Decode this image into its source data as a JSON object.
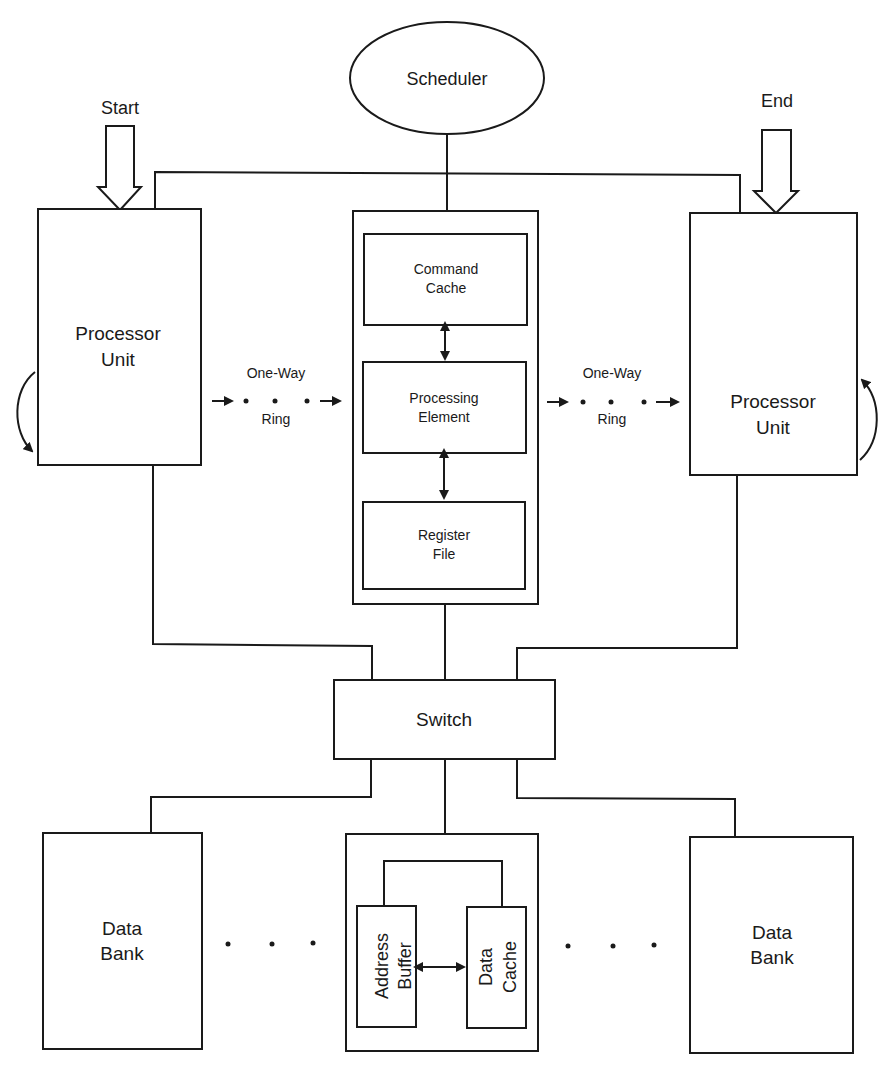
{
  "diagram": {
    "scheduler": {
      "label": "Scheduler"
    },
    "start": {
      "label": "Start"
    },
    "end": {
      "label": "End"
    },
    "left_processor": {
      "line1": "Processor",
      "line2": "Unit"
    },
    "right_processor": {
      "line1": "Processor",
      "line2": "Unit"
    },
    "left_ring": {
      "line1": "One-Way",
      "line2": "Ring"
    },
    "right_ring": {
      "line1": "One-Way",
      "line2": "Ring"
    },
    "center_unit": {
      "command_cache": {
        "line1": "Command",
        "line2": "Cache"
      },
      "processing_element": {
        "line1": "Processing",
        "line2": "Element"
      },
      "register_file": {
        "line1": "Register",
        "line2": "File"
      }
    },
    "switch": {
      "label": "Switch"
    },
    "left_data_bank": {
      "line1": "Data",
      "line2": "Bank"
    },
    "right_data_bank": {
      "line1": "Data",
      "line2": "Bank"
    },
    "memory_unit": {
      "address_buffer": {
        "line1": "Address",
        "line2": "Buffer"
      },
      "data_cache": {
        "line1": "Data",
        "line2": "Cache"
      }
    }
  },
  "colors": {
    "stroke": "#1a1a1a",
    "background": "#ffffff"
  }
}
